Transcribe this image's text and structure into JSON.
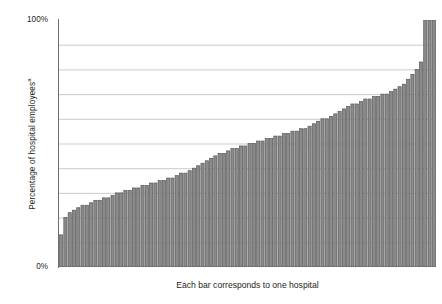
{
  "chart_data": {
    "type": "bar",
    "title": "",
    "subtitle": "",
    "xlabel": "Each bar corresponds to one hospital",
    "ylabel": "Percentage of hospital employees",
    "ylabel_superscript": "a",
    "ylim": [
      0,
      100
    ],
    "ytick_values": [
      0,
      10,
      20,
      30,
      40,
      50,
      60,
      70,
      80,
      90,
      100
    ],
    "ytick_labels_visible": [
      "0%",
      "100%"
    ],
    "ytick_top_label": "100%",
    "ytick_bottom_label": "0%",
    "grid": true,
    "grid_axis": "y",
    "gridline_count": 10,
    "legend": null,
    "legend_position": "none",
    "bar_color": "#8a8a8a",
    "bar_edge_color": "#595959",
    "grid_color": "#bcbec0",
    "axis_color": "#6d6e71",
    "text_color": "#231f20",
    "background_color": "#ffffff",
    "bar_count": 88,
    "categories": [
      "1",
      "2",
      "3",
      "4",
      "5",
      "6",
      "7",
      "8",
      "9",
      "10",
      "11",
      "12",
      "13",
      "14",
      "15",
      "16",
      "17",
      "18",
      "19",
      "20",
      "21",
      "22",
      "23",
      "24",
      "25",
      "26",
      "27",
      "28",
      "29",
      "30",
      "31",
      "32",
      "33",
      "34",
      "35",
      "36",
      "37",
      "38",
      "39",
      "40",
      "41",
      "42",
      "43",
      "44",
      "45",
      "46",
      "47",
      "48",
      "49",
      "50",
      "51",
      "52",
      "53",
      "54",
      "55",
      "56",
      "57",
      "58",
      "59",
      "60",
      "61",
      "62",
      "63",
      "64",
      "65",
      "66",
      "67",
      "68",
      "69",
      "70",
      "71",
      "72",
      "73",
      "74",
      "75",
      "76",
      "77",
      "78",
      "79",
      "80",
      "81",
      "82",
      "83",
      "84",
      "85",
      "86",
      "87",
      "88"
    ],
    "values": [
      13,
      20,
      22,
      23,
      24,
      25,
      25,
      26,
      27,
      27,
      28,
      28,
      29,
      30,
      30,
      31,
      31,
      32,
      32,
      33,
      33,
      34,
      34,
      35,
      35,
      36,
      36,
      37,
      38,
      38,
      39,
      40,
      41,
      42,
      43,
      44,
      45,
      46,
      46,
      47,
      48,
      48,
      49,
      49,
      50,
      50,
      51,
      51,
      52,
      52,
      53,
      53,
      54,
      54,
      55,
      55,
      56,
      56,
      57,
      58,
      59,
      60,
      60,
      61,
      62,
      63,
      64,
      65,
      66,
      66,
      67,
      68,
      68,
      69,
      69,
      70,
      70,
      71,
      72,
      73,
      74,
      76,
      78,
      80,
      83,
      100,
      100,
      100
    ]
  },
  "footnote_marker": "a"
}
